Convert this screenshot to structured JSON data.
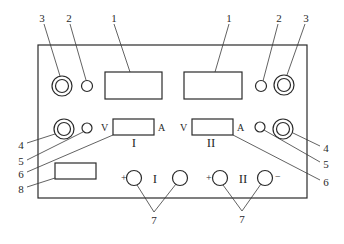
{
  "diagram": {
    "type": "instrument-front-panel",
    "callouts": {
      "display": "1",
      "indicator_lamp_top": "2",
      "knob_top": "3",
      "knob_middle": "4",
      "indicator_lamp_middle": "5",
      "meter": "6",
      "output_terminals": "7",
      "switch": "8"
    },
    "meter_labels": {
      "voltage": "V",
      "current": "A"
    },
    "channels": {
      "left": "I",
      "right": "II"
    },
    "terminal_signs": {
      "plus": "+",
      "minus": "−"
    }
  }
}
